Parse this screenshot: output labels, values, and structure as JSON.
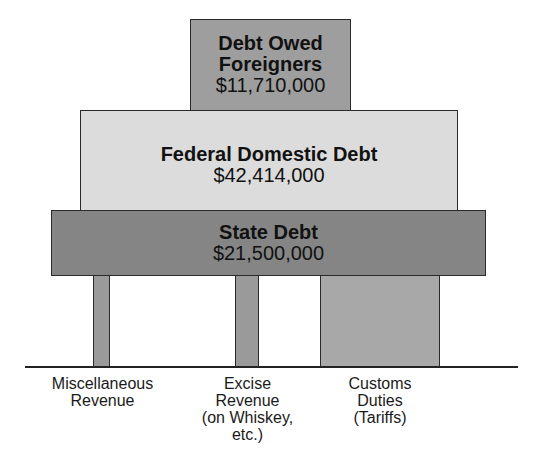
{
  "debts": {
    "foreigners": {
      "title": "Debt Owed Foreigners",
      "value": "$11,710,000",
      "color": "#9e9e9e"
    },
    "federal": {
      "title": "Federal Domestic Debt",
      "value": "$42,414,000",
      "color": "#dcdcdc"
    },
    "state": {
      "title": "State Debt",
      "value": "$21,500,000",
      "color": "#858585"
    }
  },
  "supports": {
    "misc": {
      "label": "Miscellaneous\nRevenue"
    },
    "excise": {
      "label": "Excise\nRevenue\n(on Whiskey,\netc.)"
    },
    "customs": {
      "label": "Customs\nDuties\n(Tariffs)"
    }
  }
}
